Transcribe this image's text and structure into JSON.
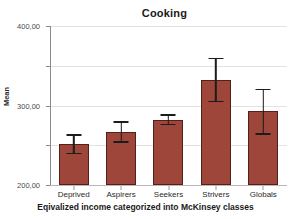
{
  "chart_data": {
    "type": "bar",
    "title": "Cooking",
    "xlabel": "Eqivalized income categorized into McKinsey classes",
    "ylabel": "Mean",
    "categories": [
      "Deprived",
      "Aspirers",
      "Seekers",
      "Strivers",
      "Globals"
    ],
    "values": [
      102,
      133,
      164,
      265,
      185
    ],
    "error_low": [
      77,
      106,
      150,
      209,
      127
    ],
    "error_high": [
      128,
      160,
      178,
      320,
      242
    ],
    "ylim": [
      0,
      400
    ],
    "yticks": [
      0,
      100,
      200,
      300,
      400
    ],
    "ytick_labels": [
      "0,00",
      "100,00",
      "200,00",
      "300,00",
      "400,00"
    ],
    "grid": true,
    "legend": false,
    "bar_color": "#9f463b",
    "bar_border_color": "#55201a",
    "error_bar_color": "#1c1c1c",
    "gridline_color": "#e2e2e2",
    "axis_color": "#8a8a8a",
    "background_color": "#ffffff",
    "error_note": "95% CI"
  }
}
